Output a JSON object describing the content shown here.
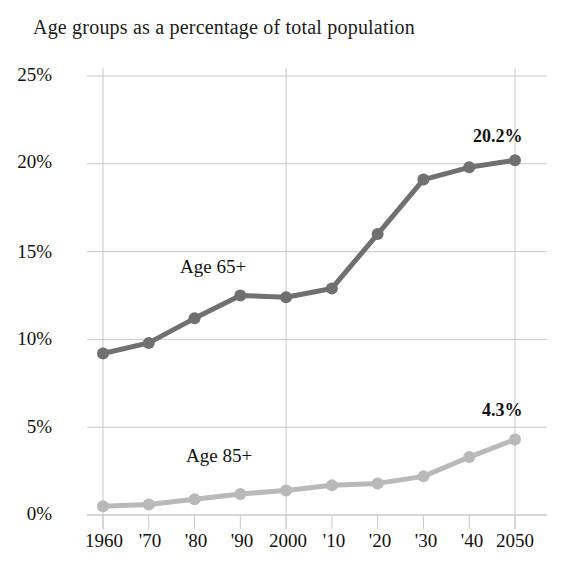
{
  "chart_data": {
    "type": "line",
    "title": "Age groups as a percentage of total population",
    "xlabel": "",
    "ylabel": "",
    "categories": [
      "1960",
      "'70",
      "'80",
      "'90",
      "2000",
      "'10",
      "'20",
      "'30",
      "'40",
      "2050"
    ],
    "x": [
      1960,
      1970,
      1980,
      1990,
      2000,
      2010,
      2020,
      2030,
      2040,
      2050
    ],
    "ylim": [
      0,
      25
    ],
    "xlim": [
      1960,
      2050
    ],
    "ytick_labels": [
      "25%",
      "20%",
      "15%",
      "10%",
      "5%",
      "0%"
    ],
    "ytick_values": [
      25,
      20,
      15,
      10,
      5,
      0
    ],
    "grid": true,
    "legend_position": "inline-annotations",
    "series": [
      {
        "name": "Age 65+",
        "color": "#707070",
        "values": [
          9.2,
          9.8,
          11.2,
          12.5,
          12.4,
          12.9,
          16.0,
          19.1,
          19.8,
          20.2
        ],
        "end_label": "20.2%"
      },
      {
        "name": "Age 85+",
        "color": "#b9b9b9",
        "values": [
          0.5,
          0.6,
          0.9,
          1.2,
          1.4,
          1.7,
          1.8,
          2.2,
          3.3,
          4.3
        ],
        "end_label": "4.3%"
      }
    ],
    "annotations": [
      {
        "text": "Age 65+",
        "x_pct": 33,
        "y_pct": 47
      },
      {
        "text": "Age 85+",
        "x_pct": 35,
        "y_pct": 79
      }
    ],
    "axis_color": "#c8c8c8",
    "text_color": "#111111"
  }
}
